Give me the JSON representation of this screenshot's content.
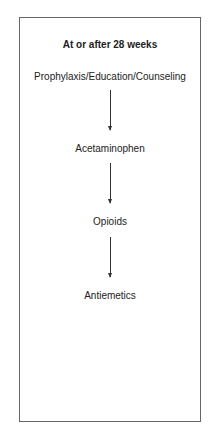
{
  "diagram": {
    "title": "At or after 28 weeks",
    "steps": [
      "Prophylaxis/Education/Counseling",
      "Acetaminophen",
      "Opioids",
      "Antiemetics"
    ]
  }
}
